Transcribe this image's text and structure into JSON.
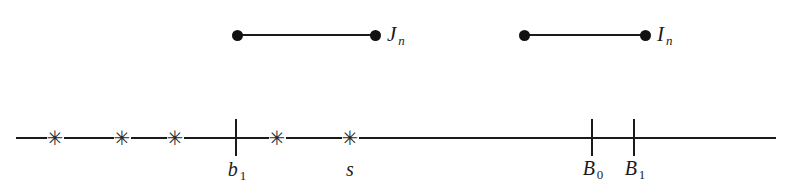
{
  "figure": {
    "background_color": "#ffffff",
    "ink_color": "#1a1a1a",
    "width": 790,
    "height": 196
  },
  "intervals": [
    {
      "name": "J-interval",
      "label_text": "J",
      "label_sub": "n",
      "x_start": 237,
      "x_end": 375,
      "y": 35,
      "label_x": 387,
      "label_y": 22
    },
    {
      "name": "I-interval",
      "label_text": "I",
      "label_sub": "n",
      "x_start": 524,
      "x_end": 645,
      "y": 35,
      "label_x": 657,
      "label_y": 22
    }
  ],
  "axis": {
    "x_start": 16,
    "x_end": 776,
    "y": 138,
    "stars": [
      {
        "name": "star-mark-1",
        "glyph": "✳",
        "x": 55
      },
      {
        "name": "star-mark-2",
        "glyph": "✳",
        "x": 122
      },
      {
        "name": "star-mark-3",
        "glyph": "✳",
        "x": 175
      },
      {
        "name": "star-mark-4",
        "glyph": "✳",
        "x": 277
      },
      {
        "name": "star-mark-5",
        "glyph": "✳",
        "x": 350
      }
    ],
    "ticks": [
      {
        "name": "tick-b1",
        "x": 235,
        "label_text": "b",
        "label_sub": "1"
      },
      {
        "name": "tick-s",
        "x": 350,
        "label_text": "s",
        "label_sub": ""
      },
      {
        "name": "tick-B0",
        "x": 591,
        "label_text": "B",
        "label_sub": "0"
      },
      {
        "name": "tick-B1",
        "x": 633,
        "label_text": "B",
        "label_sub": "1"
      }
    ]
  }
}
